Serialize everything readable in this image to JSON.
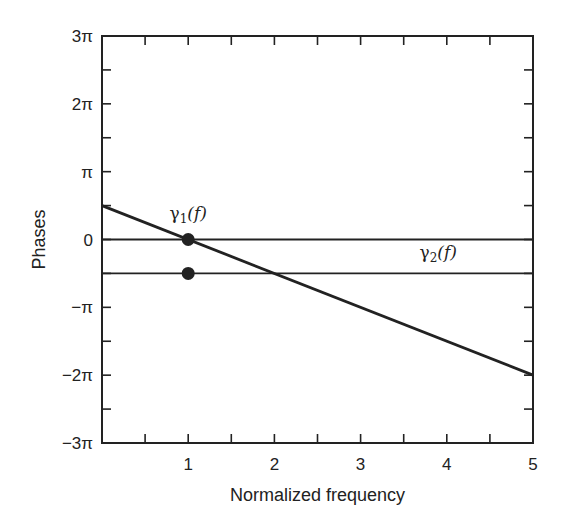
{
  "chart_data": {
    "type": "line",
    "title": "",
    "xlabel": "Normalized frequency",
    "ylabel": "Phases",
    "xlim": [
      0,
      5
    ],
    "ylim_in_pi": [
      -3,
      3
    ],
    "x_ticks": [
      0.5,
      1,
      1.5,
      2,
      2.5,
      3,
      3.5,
      4,
      4.5,
      5
    ],
    "x_tick_labels": [
      {
        "value": 1,
        "label": "1"
      },
      {
        "value": 2,
        "label": "2"
      },
      {
        "value": 3,
        "label": "3"
      },
      {
        "value": 4,
        "label": "4"
      },
      {
        "value": 5,
        "label": "5"
      }
    ],
    "y_ticks_in_pi": [
      -3,
      -2.5,
      -2,
      -1.5,
      -1,
      -0.5,
      0,
      0.5,
      1,
      1.5,
      2,
      2.5,
      3
    ],
    "y_tick_labels": [
      {
        "value_in_pi": 3,
        "label": "3π"
      },
      {
        "value_in_pi": 2,
        "label": "2π"
      },
      {
        "value_in_pi": 1,
        "label": "π"
      },
      {
        "value_in_pi": 0,
        "label": "0"
      },
      {
        "value_in_pi": -1,
        "label": "−π"
      },
      {
        "value_in_pi": -2,
        "label": "−2π"
      },
      {
        "value_in_pi": -3,
        "label": "−3π"
      }
    ],
    "grid": false,
    "series": [
      {
        "name": "linear phase",
        "x": [
          0,
          5
        ],
        "y_in_pi": [
          0.5,
          -2
        ],
        "style": "thick"
      },
      {
        "name": "zero level",
        "x": [
          0,
          5
        ],
        "y_in_pi": [
          0,
          0
        ],
        "style": "thin"
      },
      {
        "name": "minus half pi level",
        "x": [
          0,
          5
        ],
        "y_in_pi": [
          -0.5,
          -0.5
        ],
        "style": "thin"
      }
    ],
    "points": [
      {
        "x": 1,
        "y_in_pi": 0
      },
      {
        "x": 1,
        "y_in_pi": -0.5
      }
    ],
    "annotations": [
      {
        "text": "γ1(f)",
        "base": "γ",
        "sub": "1",
        "rest": "(f)",
        "x": 1,
        "y_in_pi": 0.3
      },
      {
        "text": "γ2(f)",
        "base": "γ",
        "sub": "2",
        "rest": "(f)",
        "x": 3.9,
        "y_in_pi": -0.27
      }
    ],
    "legend": null
  },
  "colors": {
    "ink": "#222222",
    "background": "#ffffff"
  }
}
